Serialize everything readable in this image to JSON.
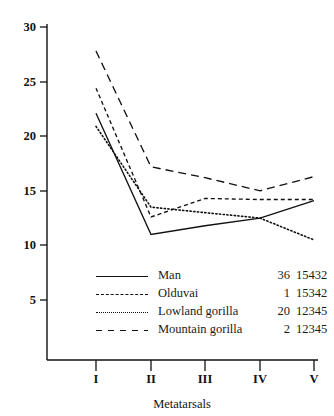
{
  "chart_data": {
    "type": "line",
    "title": "",
    "subtitle": "",
    "xlabel": "Metatarsals",
    "ylabel": "",
    "categories": [
      "I",
      "II",
      "III",
      "IV",
      "V"
    ],
    "x_tick_labels": [
      "I",
      "II",
      "III",
      "IV",
      "V"
    ],
    "y_tick_labels": [
      "5",
      "10",
      "15",
      "20",
      "25",
      "30"
    ],
    "y_ticks": [
      5,
      10,
      15,
      20,
      25,
      30
    ],
    "ylim": [
      0,
      30
    ],
    "xlim": [
      0,
      6
    ],
    "grid": false,
    "legend_position": "lower center",
    "series": [
      {
        "name": "Man",
        "count": "36",
        "code": "15432",
        "linestyle": "solid",
        "color": "#111111",
        "values": [
          22.1,
          11.0,
          11.8,
          12.5,
          14.1
        ]
      },
      {
        "name": "Olduvai",
        "count": "1",
        "code": "15342",
        "linestyle": "dashed",
        "color": "#111111",
        "values": [
          24.4,
          12.6,
          14.3,
          14.2,
          14.2
        ]
      },
      {
        "name": "Lowland gorilla",
        "count": "20",
        "code": "12345",
        "linestyle": "dotted",
        "color": "#111111",
        "values": [
          20.9,
          13.5,
          13.0,
          12.5,
          10.5
        ]
      },
      {
        "name": "Mountain gorilla",
        "count": "2",
        "code": "12345",
        "linestyle": "longdash",
        "color": "#111111",
        "values": [
          27.8,
          17.2,
          16.2,
          15.0,
          16.3
        ]
      }
    ]
  },
  "axes": {
    "x_axis_title": "Metatarsals",
    "y_labels": {
      "t5": "5",
      "t10": "10",
      "t15": "15",
      "t20": "20",
      "t25": "25",
      "t30": "30"
    },
    "x_labels": {
      "i": "I",
      "ii": "II",
      "iii": "III",
      "iv": "IV",
      "v": "V"
    }
  },
  "legend": {
    "rows": [
      {
        "name": "Man",
        "count": "36",
        "code": "15432"
      },
      {
        "name": "Olduvai",
        "count": "1",
        "code": "15342"
      },
      {
        "name": "Lowland gorilla",
        "count": "20",
        "code": "12345"
      },
      {
        "name": "Mountain gorilla",
        "count": "2",
        "code": "12345"
      }
    ]
  }
}
